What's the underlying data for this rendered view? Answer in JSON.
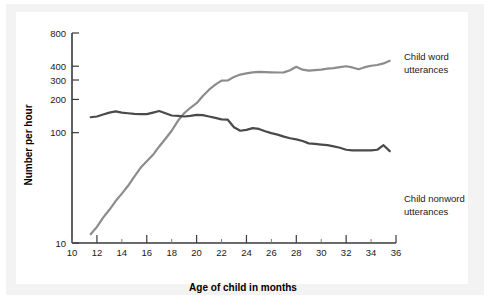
{
  "figure": {
    "background": "#ffffff",
    "mount_color": "#f3f3f3",
    "panel_color": "#ffffff"
  },
  "chart_data": {
    "type": "line",
    "title": "",
    "xlabel": "Age of child in months",
    "ylabel": "Number per hour",
    "xlim": [
      10,
      36
    ],
    "ylim": [
      10,
      800
    ],
    "yscale": "log",
    "grid": false,
    "legend_position": "right-inline",
    "xticks": [
      10,
      12,
      14,
      16,
      18,
      20,
      22,
      24,
      26,
      28,
      30,
      32,
      34,
      36
    ],
    "xticklabels": [
      "10",
      "12",
      "14",
      "16",
      "18",
      "20",
      "22",
      "24",
      "26",
      "28",
      "30",
      "32",
      "34",
      "36"
    ],
    "yticks": [
      10,
      100,
      200,
      300,
      400,
      800
    ],
    "yticklabels": [
      "10",
      "100",
      "200",
      "300",
      "400",
      "800"
    ],
    "series": [
      {
        "name": "Child word utterances",
        "label_line1": "Child word",
        "label_line2": "utterances",
        "color": "#8c8c8c",
        "x": [
          11.5,
          12.0,
          12.5,
          13.0,
          13.5,
          14.0,
          14.5,
          15.0,
          15.5,
          16.0,
          16.5,
          17.0,
          17.5,
          18.0,
          18.5,
          19.0,
          19.5,
          20.0,
          20.5,
          21.0,
          21.5,
          22.0,
          22.5,
          23.0,
          23.5,
          24.0,
          24.5,
          25.0,
          25.5,
          26.0,
          26.5,
          27.0,
          27.5,
          28.0,
          28.5,
          29.0,
          29.5,
          30.0,
          30.5,
          31.0,
          31.5,
          32.0,
          32.5,
          33.0,
          33.5,
          34.0,
          34.5,
          35.0,
          35.5
        ],
        "values": [
          12,
          14,
          17,
          20,
          24,
          28,
          33,
          40,
          48,
          55,
          63,
          75,
          88,
          104,
          128,
          150,
          168,
          185,
          215,
          245,
          272,
          296,
          297,
          320,
          336,
          345,
          352,
          356,
          354,
          352,
          351,
          352,
          368,
          395,
          372,
          365,
          368,
          372,
          380,
          385,
          392,
          400,
          390,
          375,
          392,
          404,
          410,
          424,
          448
        ]
      },
      {
        "name": "Child nonword utterances",
        "label_line1": "Child nonword",
        "label_line2": "utterances",
        "color": "#4a4a4a",
        "x": [
          11.5,
          12.0,
          12.5,
          13.0,
          13.5,
          14.0,
          14.5,
          15.0,
          15.5,
          16.0,
          16.5,
          17.0,
          17.5,
          18.0,
          18.5,
          19.0,
          19.5,
          20.0,
          20.5,
          21.0,
          21.5,
          22.0,
          22.5,
          23.0,
          23.5,
          24.0,
          24.5,
          25.0,
          25.5,
          26.0,
          26.5,
          27.0,
          27.5,
          28.0,
          28.5,
          29.0,
          29.5,
          30.0,
          30.5,
          31.0,
          31.5,
          32.0,
          32.5,
          33.0,
          33.5,
          34.0,
          34.5,
          35.0,
          35.5
        ],
        "values": [
          138,
          140,
          146,
          152,
          156,
          152,
          150,
          148,
          147,
          147,
          152,
          157,
          150,
          143,
          142,
          140,
          142,
          145,
          144,
          140,
          136,
          132,
          131,
          112,
          104,
          106,
          110,
          108,
          103,
          99,
          96,
          92,
          89,
          87,
          84,
          80,
          79,
          78,
          77,
          75,
          73,
          70,
          69,
          69,
          69,
          69,
          70,
          77,
          68
        ]
      }
    ]
  }
}
